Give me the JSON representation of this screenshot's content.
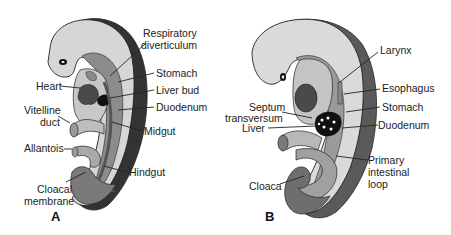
{
  "figure": {
    "panels": [
      {
        "id": "A",
        "label": "A",
        "structures": {
          "respiratory_diverticulum": [
            "Respiratory",
            "diverticulum"
          ],
          "heart": "Heart",
          "stomach": "Stomach",
          "liver_bud": "Liver bud",
          "vitelline_duct": [
            "Vitelline",
            "duct"
          ],
          "duodenum": "Duodenum",
          "midgut": "Midgut",
          "allantois": "Allantois",
          "hindgut": "Hindgut",
          "cloacal_membrane": [
            "Cloacal",
            "membrane"
          ]
        },
        "signature": "a.d."
      },
      {
        "id": "B",
        "label": "B",
        "structures": {
          "larynx": "Larynx",
          "esophagus": "Esophagus",
          "septum_transversum": [
            "Septum",
            "transversum"
          ],
          "stomach": "Stomach",
          "liver": "Liver",
          "duodenum": "Duodenum",
          "primary_intestinal_loop": [
            "Primary",
            "intestinal",
            "loop"
          ],
          "cloaca": "Cloaca"
        }
      }
    ],
    "colors": {
      "embryo_body": "#d9d9d9",
      "body_wall_dark": "#3a3a3a",
      "gut_mid": "#9a9a9a",
      "gut_light": "#c4c4c4",
      "heart": "#4a4a4a",
      "liver": "#111111",
      "outline": "#222222"
    }
  }
}
